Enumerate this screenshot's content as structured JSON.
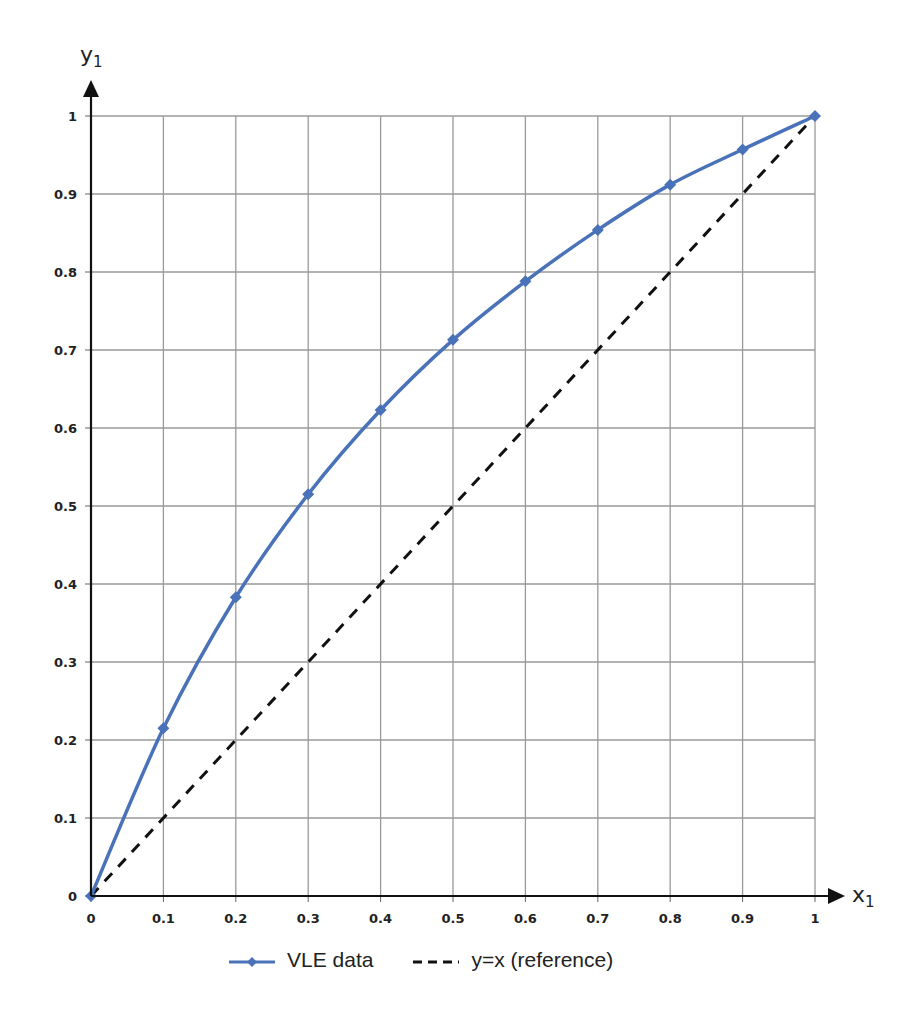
{
  "chart_data": {
    "type": "line",
    "title": "",
    "xlabel": "x1",
    "ylabel": "y1",
    "xlim": [
      0,
      1
    ],
    "ylim": [
      0,
      1
    ],
    "grid": true,
    "legend_position": "bottom",
    "x_ticks": [
      "0",
      "0.1",
      "0.2",
      "0.3",
      "0.4",
      "0.5",
      "0.6",
      "0.7",
      "0.8",
      "0.9",
      "1"
    ],
    "y_ticks": [
      "0",
      "0.1",
      "0.2",
      "0.3",
      "0.4",
      "0.5",
      "0.6",
      "0.7",
      "0.8",
      "0.9",
      "1"
    ],
    "series": [
      {
        "name": "VLE data",
        "style": "solid line with diamond markers",
        "color": "#4a72b8",
        "x": [
          0,
          0.1,
          0.2,
          0.3,
          0.4,
          0.5,
          0.6,
          0.7,
          0.8,
          0.9,
          1.0
        ],
        "y": [
          0,
          0.215,
          0.383,
          0.515,
          0.623,
          0.713,
          0.788,
          0.854,
          0.912,
          0.957,
          1.0
        ]
      },
      {
        "name": "y=x (reference)",
        "style": "dashed line",
        "color": "#111111",
        "x": [
          0,
          1
        ],
        "y": [
          0,
          1
        ]
      }
    ]
  },
  "axes": {
    "x_label_main": "x",
    "x_label_sub": "1",
    "y_label_main": "y",
    "y_label_sub": "1"
  },
  "legend": {
    "items": [
      {
        "label": "VLE data"
      },
      {
        "label": "y=x (reference)"
      }
    ]
  }
}
